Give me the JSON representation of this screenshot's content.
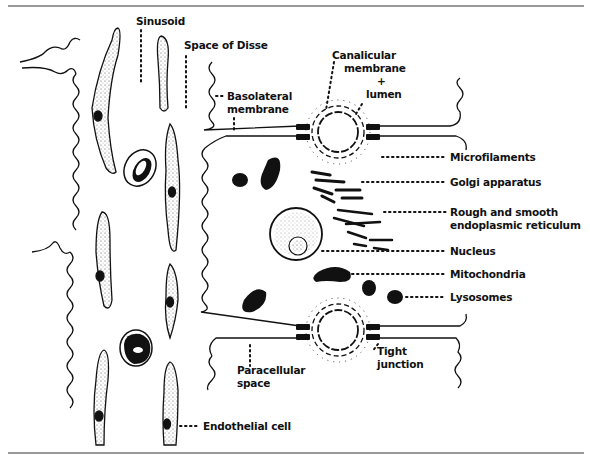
{
  "diagram": {
    "colors": {
      "ink": "#111111",
      "paper": "#ffffff",
      "rule": "#777777"
    },
    "labels": {
      "sinusoid": "Sinusoid",
      "space_of_disse": "Space of Disse",
      "basolateral_1": "Basolateral",
      "basolateral_2": "membrane",
      "canalicular_1": "Canalicular",
      "canalicular_2": "membrane",
      "canalicular_3": "+",
      "canalicular_4": "lumen",
      "microfilaments": "Microfilaments",
      "golgi": "Golgi apparatus",
      "er_1": "Rough and smooth",
      "er_2": "endoplasmic reticulum",
      "nucleus": "Nucleus",
      "mitochondria": "Mitochondria",
      "lysosomes": "Lysosomes",
      "paracellular_1": "Paracellular",
      "paracellular_2": "space",
      "tight_1": "Tight",
      "tight_2": "junction",
      "endothelial": "Endothelial cell"
    }
  }
}
